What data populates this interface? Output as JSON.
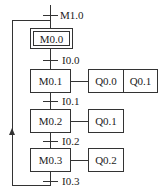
{
  "diagram": {
    "type": "sequential function chart",
    "initial_step": "M0.0",
    "transitions": [
      "M1.0",
      "I0.0",
      "I0.1",
      "I0.2",
      "I0.3"
    ],
    "steps": [
      {
        "label": "M0.0",
        "actions": []
      },
      {
        "label": "M0.1",
        "actions": [
          "Q0.0",
          "Q0.1"
        ]
      },
      {
        "label": "M0.2",
        "actions": [
          "Q0.1"
        ]
      },
      {
        "label": "M0.3",
        "actions": [
          "Q0.2"
        ]
      }
    ]
  }
}
